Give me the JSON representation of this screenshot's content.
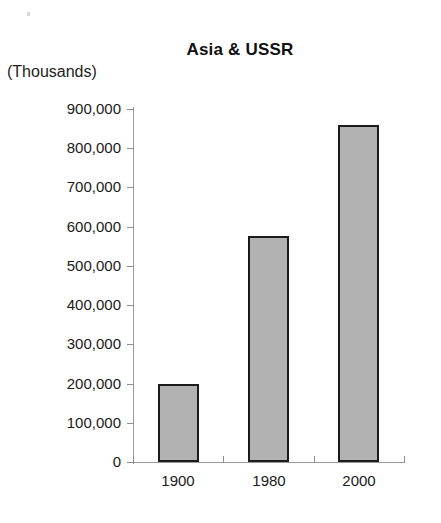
{
  "chart_data": {
    "type": "bar",
    "title": "Asia & USSR",
    "subtitle": "",
    "units_label": "(Thousands)",
    "xlabel": "",
    "ylabel": "",
    "categories": [
      "1900",
      "1980",
      "2000"
    ],
    "values": [
      200000,
      575000,
      860000
    ],
    "series": [
      {
        "name": "Asia & USSR",
        "values": [
          200000,
          575000,
          860000
        ]
      }
    ],
    "ylim": [
      0,
      900000
    ],
    "ytick_values": [
      900000,
      800000,
      700000,
      600000,
      500000,
      400000,
      300000,
      200000,
      100000,
      0
    ],
    "ytick_labels": [
      "900,000",
      "800,000",
      "700,000",
      "600,000",
      "500,000",
      "400,000",
      "300,000",
      "200,000",
      "100,000",
      "0"
    ],
    "ytick_interval": 100000,
    "grid": false,
    "legend": false,
    "legend_position": "none",
    "bar_fill_color": "#b2b2b2",
    "bar_border_color": "#1b1b1b",
    "axis_color": "#9a9a9a",
    "background_color": "#ffffff",
    "text_color": "#1a1a1a"
  }
}
